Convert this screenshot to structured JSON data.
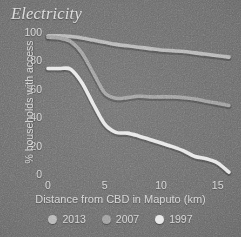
{
  "chart_data": {
    "type": "line",
    "title": "Electricity",
    "xlabel": "Distance from CBD in Maputo (km)",
    "ylabel": "% households with access",
    "xlim": [
      0,
      16
    ],
    "ylim": [
      0,
      100
    ],
    "xticks": [
      "0",
      "5",
      "10",
      "15"
    ],
    "xtick_values": [
      0,
      5,
      10,
      15
    ],
    "yticks": [
      "0",
      "20",
      "40",
      "60",
      "80",
      "100"
    ],
    "ytick_values": [
      0,
      20,
      40,
      60,
      80,
      100
    ],
    "grid": false,
    "legend_position": "bottom",
    "x": [
      0,
      1,
      2,
      3,
      4,
      5,
      6,
      7,
      8,
      9,
      10,
      11,
      12,
      13,
      14,
      15,
      16
    ],
    "series": [
      {
        "name": "2013",
        "color": "#b4b4b4",
        "values": [
          98,
          98,
          97.5,
          96.5,
          95,
          93.5,
          92,
          91,
          90,
          89,
          88,
          87.5,
          87,
          86,
          85,
          84,
          83
        ]
      },
      {
        "name": "2007",
        "color": "#9a9a9a",
        "values": [
          97,
          96.5,
          94,
          86,
          72,
          58,
          54,
          54.5,
          55.5,
          55,
          55,
          55,
          54.5,
          53.5,
          52,
          50.5,
          49
        ]
      },
      {
        "name": "1997",
        "color": "#e6e6e6",
        "values": [
          75,
          75,
          74.5,
          65,
          50,
          36,
          30,
          29.5,
          27.5,
          25,
          22.5,
          20,
          17,
          13,
          11.5,
          8.5,
          2
        ]
      }
    ]
  },
  "legend": {
    "items": [
      {
        "label": "2013",
        "color": "#b4b4b4"
      },
      {
        "label": "2007",
        "color": "#9a9a9a"
      },
      {
        "label": "1997",
        "color": "#e6e6e6"
      }
    ]
  },
  "colors": {
    "background": "#6a6a6a",
    "text": "#cfcfcf",
    "title": "#d8d8d8"
  }
}
